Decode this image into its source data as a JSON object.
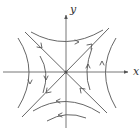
{
  "diagram": {
    "type": "phase-portrait",
    "axes": {
      "x_label": "x",
      "y_label": "y"
    },
    "colors": {
      "stroke": "#555555",
      "axis": "#666666",
      "background": "#ffffff"
    },
    "manifolds": [
      {
        "name": "stable",
        "direction": "toward-origin",
        "from": "upper-left / lower-right"
      },
      {
        "name": "unstable",
        "direction": "away-from-origin",
        "from": "lower-left / upper-right"
      }
    ],
    "trajectory_directions": {
      "top": "right",
      "bottom": "left",
      "left": "down",
      "right": "up"
    }
  }
}
